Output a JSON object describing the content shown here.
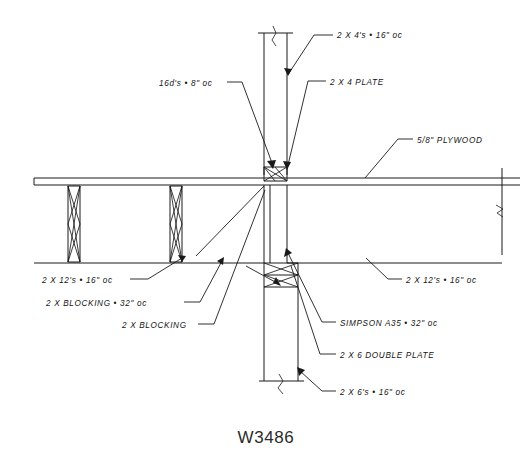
{
  "drawing": {
    "title": "W3486",
    "sheet_label": "W3486",
    "ink_color": "#1a1a1a",
    "background_color": "#ffffff"
  },
  "annotations": [
    {
      "id": "studs-2x4",
      "text": "2 X 4's • 16\" oc",
      "x": 337,
      "y": 32
    },
    {
      "id": "plate-2x4",
      "text": "2 X 4 PLATE",
      "x": 330,
      "y": 79
    },
    {
      "id": "nails-16d",
      "text": "16d's • 8\" oc",
      "x": 159,
      "y": 80
    },
    {
      "id": "plywood",
      "text": "5/8\" PLYWOOD",
      "x": 417,
      "y": 137
    },
    {
      "id": "joists-left",
      "text": "2 X 12's • 16\" oc",
      "x": 42,
      "y": 277
    },
    {
      "id": "blocking-32",
      "text": "2 X BLOCKING • 32\" oc",
      "x": 46,
      "y": 300
    },
    {
      "id": "blocking",
      "text": "2 X BLOCKING",
      "x": 122,
      "y": 322
    },
    {
      "id": "joists-right",
      "text": "2 X 12's • 16\" oc",
      "x": 406,
      "y": 277
    },
    {
      "id": "simpson-a35",
      "text": "SIMPSON A35 • 32\" oc",
      "x": 340,
      "y": 320
    },
    {
      "id": "double-plate",
      "text": "2 X 6 DOUBLE PLATE",
      "x": 340,
      "y": 352
    },
    {
      "id": "studs-2x6",
      "text": "2 X 6's • 16\" oc",
      "x": 340,
      "y": 389
    }
  ]
}
